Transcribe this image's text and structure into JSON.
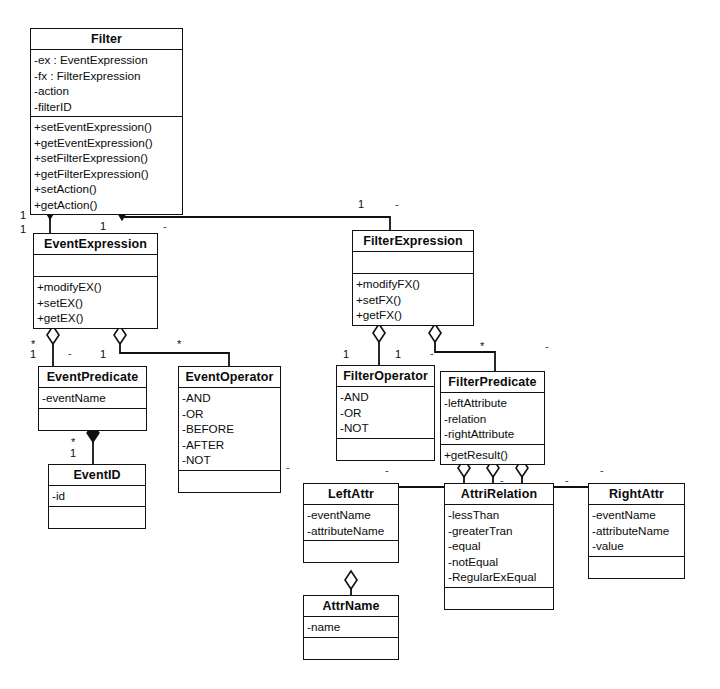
{
  "diagram": {
    "type": "uml-class-diagram",
    "background_color": "#ffffff",
    "line_color": "#111111"
  },
  "classes": [
    {
      "id": "filter",
      "name": "Filter",
      "x": 30,
      "y": 28,
      "width": 153,
      "attributes": [
        "-ex : EventExpression",
        "-fx : FilterExpression",
        "-action",
        "-filterID"
      ],
      "operations": [
        "+setEventExpression()",
        "+getEventExpression()",
        "+setFilterExpression()",
        "+getFilterExpression()",
        "+setAction()",
        "+getAction()"
      ],
      "empty_attributes": false,
      "empty_operations": false
    },
    {
      "id": "event-expression",
      "name": "EventExpression",
      "x": 33,
      "y": 233,
      "width": 125,
      "attributes": [],
      "operations": [
        "+modifyEX()",
        "+setEX()",
        "+getEX()"
      ],
      "empty_attributes": true,
      "empty_operations": false
    },
    {
      "id": "filter-expression",
      "name": "FilterExpression",
      "x": 352,
      "y": 230,
      "width": 122,
      "attributes": [],
      "operations": [
        "+modifyFX()",
        "+setFX()",
        "+getFX()"
      ],
      "empty_attributes": true,
      "empty_operations": false
    },
    {
      "id": "event-predicate",
      "name": "EventPredicate",
      "x": 38,
      "y": 366,
      "width": 109,
      "attributes": [
        "-eventName"
      ],
      "operations": [],
      "empty_attributes": false,
      "empty_operations": true
    },
    {
      "id": "event-operator",
      "name": "EventOperator",
      "x": 178,
      "y": 366,
      "width": 103,
      "attributes": [
        "-AND",
        "-OR",
        "-BEFORE",
        "-AFTER",
        "-NOT"
      ],
      "operations": [],
      "empty_attributes": false,
      "empty_operations": true
    },
    {
      "id": "event-id",
      "name": "EventID",
      "x": 48,
      "y": 464,
      "width": 98,
      "attributes": [
        "-id"
      ],
      "operations": [],
      "empty_attributes": false,
      "empty_operations": true
    },
    {
      "id": "filter-operator",
      "name": "FilterOperator",
      "x": 336,
      "y": 365,
      "width": 99,
      "attributes": [
        "-AND",
        "-OR",
        "-NOT"
      ],
      "operations": [],
      "empty_attributes": false,
      "empty_operations": true
    },
    {
      "id": "filter-predicate",
      "name": "FilterPredicate",
      "x": 440,
      "y": 371,
      "width": 105,
      "attributes": [
        "-leftAttribute",
        "-relation",
        "-rightAttribute"
      ],
      "operations": [
        "+getResult()"
      ],
      "empty_attributes": false,
      "empty_operations": false
    },
    {
      "id": "left-attr",
      "name": "LeftAttr",
      "x": 303,
      "y": 483,
      "width": 96,
      "attributes": [
        "-eventName",
        "-attributeName"
      ],
      "operations": [],
      "empty_attributes": false,
      "empty_operations": true
    },
    {
      "id": "attri-relation",
      "name": "AttriRelation",
      "x": 444,
      "y": 483,
      "width": 110,
      "attributes": [
        "-lessThan",
        "-greaterTran",
        "-equal",
        "-notEqual",
        "-RegularExEqual"
      ],
      "operations": [],
      "empty_attributes": false,
      "empty_operations": true
    },
    {
      "id": "right-attr",
      "name": "RightAttr",
      "x": 588,
      "y": 483,
      "width": 97,
      "attributes": [
        "-eventName",
        "-attributeName",
        "-value"
      ],
      "operations": [],
      "empty_attributes": false,
      "empty_operations": true
    },
    {
      "id": "attr-name",
      "name": "AttrName",
      "x": 303,
      "y": 595,
      "width": 96,
      "attributes": [
        "-name"
      ],
      "operations": [],
      "empty_attributes": false,
      "empty_operations": true
    }
  ],
  "relationships": [
    {
      "id": "filter-eventexpression",
      "from": "Filter",
      "to": "EventExpression",
      "kind": "composition",
      "source_multiplicity": "1",
      "target_multiplicity": "1"
    },
    {
      "id": "filter-filterexpression",
      "from": "Filter",
      "to": "FilterExpression",
      "kind": "composition",
      "source_multiplicity": "1",
      "target_multiplicity": "1"
    },
    {
      "id": "eventexpression-eventpredicate",
      "from": "EventExpression",
      "to": "EventPredicate",
      "kind": "aggregation",
      "source_multiplicity": "1",
      "target_multiplicity": "*"
    },
    {
      "id": "eventexpression-eventoperator",
      "from": "EventExpression",
      "to": "EventOperator",
      "kind": "aggregation",
      "source_multiplicity": "1",
      "target_multiplicity": "*"
    },
    {
      "id": "eventpredicate-eventid",
      "from": "EventPredicate",
      "to": "EventID",
      "kind": "composition",
      "source_multiplicity": "1",
      "target_multiplicity": "*"
    },
    {
      "id": "filterexpression-filteroperator",
      "from": "FilterExpression",
      "to": "FilterOperator",
      "kind": "aggregation",
      "source_multiplicity": "1",
      "target_multiplicity": "*"
    },
    {
      "id": "filterexpression-filterpredicate",
      "from": "FilterExpression",
      "to": "FilterPredicate",
      "kind": "aggregation",
      "source_multiplicity": "1",
      "target_multiplicity": "*"
    },
    {
      "id": "filterpredicate-leftattr",
      "from": "FilterPredicate",
      "to": "LeftAttr",
      "kind": "aggregation",
      "source_multiplicity": "",
      "target_multiplicity": "*"
    },
    {
      "id": "filterpredicate-attrirelation",
      "from": "FilterPredicate",
      "to": "AttriRelation",
      "kind": "aggregation",
      "source_multiplicity": "",
      "target_multiplicity": "*"
    },
    {
      "id": "filterpredicate-rightattr",
      "from": "FilterPredicate",
      "to": "RightAttr",
      "kind": "aggregation",
      "source_multiplicity": "",
      "target_multiplicity": "*"
    },
    {
      "id": "leftattr-attrname",
      "from": "LeftAttr",
      "to": "AttrName",
      "kind": "aggregation",
      "source_multiplicity": "",
      "target_multiplicity": ""
    }
  ],
  "multiplicity_labels": [
    {
      "id": "m-filter-ex-top",
      "text": "1",
      "x": 20,
      "y": 209
    },
    {
      "id": "m-filter-ex-bottom",
      "text": "1",
      "x": 20,
      "y": 223
    },
    {
      "id": "m-eventexpression-top",
      "text": "1",
      "x": 100,
      "y": 220
    },
    {
      "id": "m-filter-fx",
      "text": "1",
      "x": 358,
      "y": 198
    },
    {
      "id": "m-eventexpr-pred",
      "text": "1",
      "x": 30,
      "y": 348
    },
    {
      "id": "m-eventexpr-pred-star",
      "text": "*",
      "x": 31,
      "y": 338
    },
    {
      "id": "m-eventexpr-op",
      "text": "1",
      "x": 100,
      "y": 348
    },
    {
      "id": "m-eventexpr-op-star",
      "text": "*",
      "x": 177,
      "y": 338
    },
    {
      "id": "m-eventpred-id-star",
      "text": "*",
      "x": 71,
      "y": 436
    },
    {
      "id": "m-eventpred-id",
      "text": "1",
      "x": 70,
      "y": 447
    },
    {
      "id": "m-filterexpr-op",
      "text": "1",
      "x": 343,
      "y": 348
    },
    {
      "id": "m-filterexpr-pred",
      "text": "1",
      "x": 395,
      "y": 348
    },
    {
      "id": "m-filterexpr-pred-star",
      "text": "*",
      "x": 480,
      "y": 340
    }
  ],
  "tick_marks": [
    {
      "id": "tick-filter-fx-right",
      "text": "-",
      "x": 395,
      "y": 198
    },
    {
      "id": "tick-eventexpr-right",
      "text": "-",
      "x": 163,
      "y": 220
    },
    {
      "id": "tick-eventexpr-mid",
      "text": "-",
      "x": 68,
      "y": 347
    },
    {
      "id": "tick-filterexpr-mid",
      "text": "-",
      "x": 430,
      "y": 347
    },
    {
      "id": "tick-filterexpr-right",
      "text": "-",
      "x": 545,
      "y": 340
    },
    {
      "id": "tick-eventoperator-bottom",
      "text": "-",
      "x": 286,
      "y": 461
    },
    {
      "id": "tick-filterpred-left",
      "text": "-",
      "x": 385,
      "y": 464
    },
    {
      "id": "tick-filterpred-right",
      "text": "-",
      "x": 600,
      "y": 464
    },
    {
      "id": "tick-attrirelation-top",
      "text": "-",
      "x": 500,
      "y": 474
    },
    {
      "id": "tick-rightattr-top",
      "text": "-",
      "x": 565,
      "y": 474
    }
  ]
}
